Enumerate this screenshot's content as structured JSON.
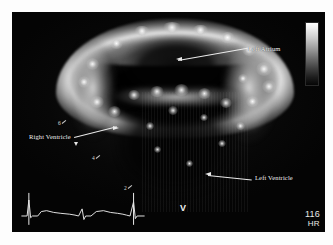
{
  "image": {
    "modality": "echocardiogram",
    "view": "four-chamber cardiac ultrasound"
  },
  "annotations": [
    {
      "id": "left-atrium",
      "label": "Left Atrium",
      "position": "upper-right"
    },
    {
      "id": "right-ventricle",
      "label": "Right Ventricle",
      "position": "mid-left"
    },
    {
      "id": "left-ventricle",
      "label": "Left Ventricle",
      "position": "lower-right"
    }
  ],
  "calipers": [
    {
      "id": "caliper-6",
      "label": "6"
    },
    {
      "id": "caliper-4",
      "label": "4"
    },
    {
      "id": "caliper-2",
      "label": "2"
    }
  ],
  "markers": {
    "sector_apex": "V"
  },
  "readout": {
    "hr_value": "116",
    "hr_unit": "HR"
  },
  "grayscale_bar": {
    "top_color": "#ffffff",
    "bottom_color": "#060606"
  },
  "ecg": {
    "trace_color": "#e4e4e4",
    "caliper_color": "#f2f2f2",
    "points": "2,30 8,30 10,12 12,32 14,30 20,30 24,25 30,24 38,26 46,27 56,28 62,29 66,30 70,22 72,34 74,30 80,30 86,25 94,24 102,26 110,27 116,28 120,29 124,30 128,14 130,33 132,30 140,30"
  },
  "colors": {
    "panel_background": "#040404",
    "page_background": "#fdfdfd",
    "annotation_text": "#f2f2f2",
    "leader_line": "#eaeaea"
  }
}
